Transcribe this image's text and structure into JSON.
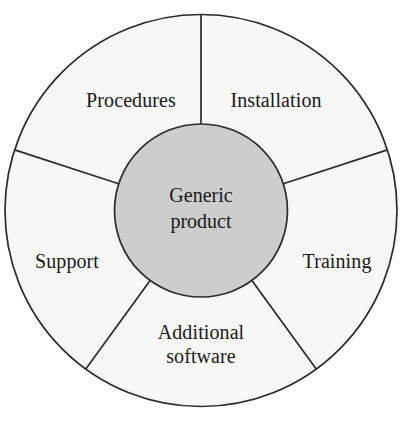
{
  "diagram": {
    "type": "donut-segmented-wheel",
    "center": {
      "label_line1": "Generic",
      "label_line2": "product"
    },
    "segments": [
      {
        "id": "installation",
        "label": "Installation",
        "label_lines": [
          "Installation"
        ],
        "start_angle_deg": -90,
        "end_angle_deg": -18
      },
      {
        "id": "training",
        "label": "Training",
        "label_lines": [
          "Training"
        ],
        "start_angle_deg": -18,
        "end_angle_deg": 54
      },
      {
        "id": "additional-software",
        "label": "Additional software",
        "label_lines": [
          "Additional",
          "software"
        ],
        "start_angle_deg": 54,
        "end_angle_deg": 126
      },
      {
        "id": "support",
        "label": "Support",
        "label_lines": [
          "Support"
        ],
        "start_angle_deg": 126,
        "end_angle_deg": 198
      },
      {
        "id": "procedures",
        "label": "Procedures",
        "label_lines": [
          "Procedures"
        ],
        "start_angle_deg": 198,
        "end_angle_deg": 270
      }
    ],
    "geometry": {
      "center_x": 201,
      "center_y": 210.5,
      "outer_radius": 196,
      "inner_radius": 86.5
    },
    "colors": {
      "ring_fill": "#f7f7f5",
      "hub_fill": "#cdcdcd",
      "stroke": "#2b2b2b",
      "background": "#ffffff",
      "text": "#1a1a1a"
    }
  }
}
